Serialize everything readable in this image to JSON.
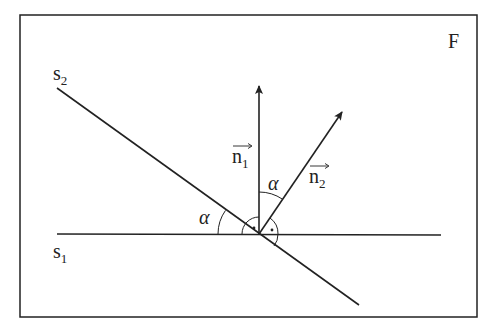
{
  "figure": {
    "frame_label": "F",
    "lines": {
      "s1": {
        "name": "s",
        "subscript": "1"
      },
      "s2": {
        "name": "s",
        "subscript": "2"
      }
    },
    "vectors": {
      "n1": {
        "name": "n",
        "subscript": "1"
      },
      "n2": {
        "name": "n",
        "subscript": "2"
      }
    },
    "angles": {
      "between_lines": "α",
      "between_normals": "α"
    },
    "colors": {
      "stroke": "#222222",
      "background": "#ffffff"
    }
  }
}
